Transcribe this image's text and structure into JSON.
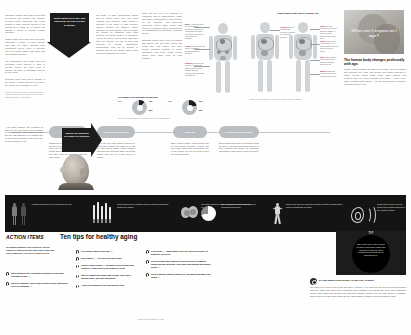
{
  "poster": {
    "hero_title": "What can I expect as I age?",
    "hero_lede_heading": "The human body changes profoundly with age.",
    "hero_lede_body": "Muscle mass decreases as body fat increases, the skin wrinkles and becomes thin, bone loss densify and growth decrease in height, internal organs (heart, lungs, brain) function less efficiently and the body's systems slow down — sight, taste, smell, sensation and hearing — as well as declines in cognition, respiration begin to fail."
  },
  "left_column": {
    "p1": "Laboratory studies show that cutting back on calories can increase your lifespan. Scientific calorie restriction can extend lifespan in many different species of lab animals by as much as 40 percent, but whether it works in humans remains uncertain.",
    "p2": "Studies show that people who eat meals, particularly in prison, or more extreme who may eat larger helpings. New researchers believe these a necessity after 100 lifetime higher than those who eat breakfast regularly.",
    "p3": "The Framingham Heart Study found that expending 2,000 calories a week in physical activity the lower point of working can have a remarkable benefits for the elders.",
    "p4": "Fractures could keep severe disease of the elderly. It would add only 12 years to the current life expectancy of 77.6.",
    "source": "Sources: Harvard Health Letter; National Institute on Aging; Centers for Disease Control and Prevention; National Institutes of Health (2005)."
  },
  "arrow_down_quote": "What causes us to age, and how do we do it as a result of aging?",
  "arrow_right_quote": "What are our prospects for healthy life extension?",
  "mid_column_b": {
    "p1": "The study of aging (gerontology) shows that as people grow only, their body functions less efficiently, which creates a reduction in the ability to fight infection. Chronic illnesses like diabetes, kidney problems or heart disease tend to become the subject by impacting other body functions like blood pressure or circulation. And as the elderly tend to suffer from more than one ailment, the use of their drug regimens in multiple medications. Recuperation from an all disease is available and as the fracture takes longer and can incapacitate the elderly."
  },
  "mid_column_c": {
    "p1": "aged. The key test is to compose or permanent loss of independence, which can trigger a dependence in the decrease for the reduction. The aging-loss experience occurs about chronic and deep level problems. These problems can be misdiagnosed or depression, dementia as well.",
    "p2": "Economic factors and a view of financial and biggest: The way other people and health care. The elderly may have greater problems because of fragile constraints, and these health service issues occur when living on fixed incomes."
  },
  "body_diagram": {
    "title": "Eight Signs That You're Getting Old",
    "labels": [
      {
        "key": "Brain",
        "text": "A person's ability to remember the contents of contextual information slips and concentration declines with aging, but gradually."
      },
      {
        "key": "Lungs",
        "text": "Muscles and ribs stiffen; maximum breathing capacity declines."
      },
      {
        "key": "Kidneys",
        "text": "Become less efficient at removing waste from the blood; bladder capacity declines and can cause incontinence."
      },
      {
        "key": "Sight",
        "text": "The lens becomes less elastic, making it harder to focus on close objects; night vision falls."
      },
      {
        "key": "Hearing",
        "text": "Difficulty hearing high frequency sounds; the ear drum thickens."
      },
      {
        "key": "Heart",
        "text": "Pumps blood less efficiently; the heart muscle thickens and the arteries stiffen."
      },
      {
        "key": "Skin",
        "text": "Loses elasticity and fat layers thin; wrinkles and age spots appear."
      },
      {
        "key": "Muscle",
        "text": "Mass and strength decline; fat replaces lean tissue."
      }
    ],
    "source": "Source: National Institute on Aging; U.S. National Library of Medicine"
  },
  "pie_pair": {
    "caption": "Percentage of the population 65 and older",
    "source": "Source: U.S. Census Bureau, 'Population Profile of the United States'",
    "charts": [
      {
        "label": "2000",
        "slices": [
          {
            "name": "65+",
            "value": 12
          },
          {
            "name": "Under 65",
            "value": 88
          }
        ],
        "legend": [
          {
            "name": "65+",
            "value": "12%"
          },
          {
            "name": "Under 65",
            "value": "88%"
          }
        ]
      },
      {
        "label": "2030",
        "slices": [
          {
            "name": "65+",
            "value": 20
          },
          {
            "name": "Under 65",
            "value": 80
          }
        ],
        "legend": [
          {
            "name": "65+",
            "value": "20%"
          },
          {
            "name": "Under 65",
            "value": "80%"
          }
        ]
      }
    ]
  },
  "timeline": {
    "intro": "A few basic changes. The oversight life span for men and women has increased by 30 years since 1900; however, people still age, and what there is of wisdom may lie from aging and society, and nearly after health and quality of life.",
    "stages": [
      {
        "label": "The Same Body",
        "text": "Though the sense organs may get smaller and the receptors that run them reduce the acuity, the biggest declines come through weight and hearing loss. Those sensations that make living the most daily task the most urgent."
      },
      {
        "label": "The Aging Heart & Arteries",
        "text": "Over time the heart muscle thickens by about 25% between the ages of 30 and 80, and arteries stiffen. Blood pressure rises with age and heart attack risk climbs steadily after age 45 in men and 55 in women."
      },
      {
        "label": "Bone Thin",
        "text": "Bone mineral density peaks around age 30 and declines thereafter. Women lose bone more rapidly after menopause; one in two women over 50 will break a bone due to osteoporosis."
      },
      {
        "label": "The Brain & Nervous System",
        "text": "Brain weight falls roughly 10% between ages 20 and 90, but new connections continue to form. Reaction time slows, yet vocabulary and judgment often improve with experience."
      }
    ]
  },
  "stats_band": [
    {
      "icon": "people-icon",
      "text": "Arthritis affects two of all Americans over 65."
    },
    {
      "icon": "cigarettes-icon",
      "text": "Most smokers are a leading cause of death and disease among the elderly."
    },
    {
      "icon": "brain-icon",
      "text": "The brain shrinks by 10% between the ages of 20 and 90."
    },
    {
      "icon": "pie-icon",
      "chart": {
        "type": "pie",
        "slices": [
          {
            "name": "reported pain",
            "value": 28
          },
          {
            "name": "no pain",
            "value": 72
          }
        ]
      },
      "text": "28% of seniors reported some severe musculoskeletal pain."
    },
    {
      "icon": "runner-icon",
      "text": "Every hour spent in vigorous exercise at least is repaid with 2 hours of additional life span."
    },
    {
      "icon": "ear-icon",
      "text": "Nearly half of those over 65 suffer from hearing loss due to the effects of aging."
    }
  ],
  "action_items": {
    "tag": "ACTION ITEMS",
    "title": "Ten tips for healthy aging",
    "lede": "No known substance can extend life, but the chances of staying healthy and living a long time can be improved. Here are ten ways to help.",
    "tips_left": [
      {
        "text": "Eat a balanced diet, including 5 helpings of fruits and vegetables a day",
        "num": "(1)."
      },
      {
        "text": "Exercise regularly (check with a doctor before starting an exercise program)",
        "num": "(2)."
      }
    ],
    "tips_right": [
      {
        "text": "Get regular health check-ups",
        "num": "(3)."
      },
      {
        "text": "Don't smoke",
        "num": "(4);",
        "tail": "it's never too late to quit."
      },
      {
        "text": "Practice safety habits",
        "num": "(5)",
        "tail": "at home to prevent falls and fractures. Always wear your seatbelt in a car."
      },
      {
        "text": "Stay in contact with family and friends. Stay active through work, play and community.",
        "num": ""
      },
      {
        "text": "Avoid overexposure to the sun and the cold.",
        "num": ""
      }
    ],
    "tips_col3": [
      {
        "text": "If you drink",
        "num": "(6),",
        "tail": "moderation is the key. When you drink, let someone else drive."
      },
      {
        "text": "Keep personal and financial records in order to simplify budgeting and investing. Plan long-term housing and money needs",
        "num": "(7)."
      },
      {
        "text": "Keep a positive attitude toward life. Do things that make you happy",
        "num": "(8)."
      }
    ],
    "source": "Source: National Institute on Aging"
  },
  "tip_box": {
    "label": "TIP",
    "text": "Take a nap early in the evening, not late in bed before. Each hour most sleep gets more than prescribed hours that can be beneficial at 64."
  },
  "qa": {
    "question": "DO WE NEED LESS SLEEP AS WE GET OLDER?",
    "answer": "The ability not to sleep less at time gets older. However, it is a myth that the need for sleep decreases with age. Many older adults have underlying sleep disorders that disturb their sleep. Sleep disorders include sleep apnea and periodic limb movement disorder limiting your feet while asleep. In addition, older people often take more during the day, which makes it harder to sleep through the night."
  }
}
